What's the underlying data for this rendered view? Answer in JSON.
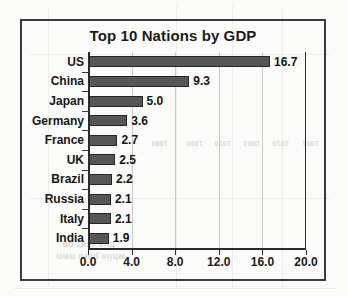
{
  "chart_data": {
    "type": "bar",
    "orientation": "horizontal",
    "title": "Top 10 Nations by GDP",
    "xlabel": "",
    "ylabel": "",
    "categories": [
      "US",
      "China",
      "Japan",
      "Germany",
      "France",
      "UK",
      "Brazil",
      "Russia",
      "Italy",
      "India"
    ],
    "values": [
      16.7,
      9.3,
      5.0,
      3.6,
      2.7,
      2.5,
      2.2,
      2.1,
      2.1,
      1.9
    ],
    "value_labels": [
      "16.7",
      "9.3",
      "5.0",
      "3.6",
      "2.7",
      "2.5",
      "2.2",
      "2.1",
      "2.1",
      "1.9"
    ],
    "xlim": [
      0.0,
      20.0
    ],
    "xticks": [
      0.0,
      4.0,
      8.0,
      12.0,
      16.0,
      20.0
    ],
    "xtick_labels": [
      "0.0",
      "4.0",
      "8.0",
      "12.0",
      "16.0",
      "20.0"
    ],
    "grid": true,
    "grid_axis": "x",
    "legend": false,
    "bar_color": "#565656",
    "bar_edge_color": "#262626",
    "frame_color": "#3b3b3b",
    "gridline_color": "#c9c9c5",
    "background_color": "#fbfbfa",
    "text_color": "#161616"
  },
  "artifacts": {
    "ghost_labels": [
      "1880",
      "1890",
      "1910",
      "2003",
      "2010",
      "1991"
    ],
    "ghost_phrases": [
      "this port on",
      "whiis paru nwn"
    ]
  }
}
